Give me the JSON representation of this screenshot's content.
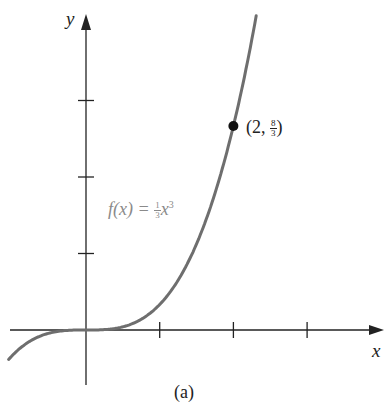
{
  "chart_data": {
    "type": "line",
    "title": "",
    "caption": "(a)",
    "xlabel": "x",
    "ylabel": "y",
    "function": "f(x) = (1/3)x^3",
    "function_label": {
      "prefix": "f(x) = ",
      "coef_num": "1",
      "coef_den": "3",
      "var": "x",
      "exp": "3"
    },
    "x_ticks": [
      1,
      2,
      3
    ],
    "y_ticks": [
      1,
      2,
      3
    ],
    "xlim": [
      -1.05,
      4.05
    ],
    "ylim": [
      -0.7,
      4.3
    ],
    "grid": false,
    "series": [
      {
        "name": "f(x) = (1/3)x^3",
        "color": "#6e6e6e",
        "x": [
          -1.05,
          -0.75,
          -0.5,
          -0.25,
          0,
          0.25,
          0.5,
          0.75,
          1,
          1.25,
          1.5,
          1.75,
          2,
          2.25,
          2.32
        ],
        "y": [
          -0.386,
          -0.141,
          -0.042,
          -0.005,
          0,
          0.005,
          0.042,
          0.141,
          0.333,
          0.651,
          1.125,
          1.786,
          2.667,
          3.797,
          4.16
        ]
      }
    ],
    "annotations": [
      {
        "type": "point",
        "x": 2,
        "y": 2.667,
        "label": "(2, 8/3)",
        "label_parts": {
          "open": "(2, ",
          "num": "8",
          "den": "3",
          "close": ")"
        }
      }
    ]
  }
}
